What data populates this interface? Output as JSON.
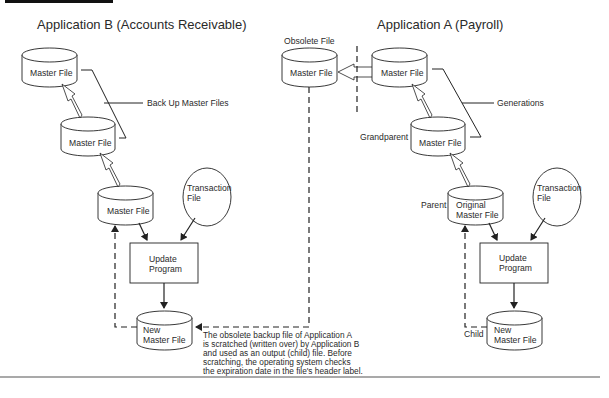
{
  "header_bar": {
    "color": "#111111"
  },
  "app_b": {
    "title": "Application B (Accounts Receivable)",
    "master_files": [
      "Master File",
      "Master File",
      "Master File"
    ],
    "bracket_label": "Back Up Master Files",
    "transaction_file": [
      "Transaction",
      "File"
    ],
    "update_program": [
      "Update",
      "Program"
    ],
    "new_master_file": [
      "New",
      "Master File"
    ]
  },
  "obsolete": {
    "label": "Obsolete File",
    "file": "Master File"
  },
  "app_a": {
    "title": "Application A (Payroll)",
    "master_file": "Master File",
    "bracket_label": "Generations",
    "grandparent_label": "Grandparent",
    "grandparent_file": "Master File",
    "parent_label": "Parent",
    "parent_file": [
      "Original",
      "Master File"
    ],
    "transaction_file": [
      "Transaction",
      "File"
    ],
    "update_program": [
      "Update",
      "Program"
    ],
    "new_master_file": [
      "New",
      "Master File"
    ],
    "child_label": "Child"
  },
  "note": [
    "The obsolete backup file of Application A",
    "is scratched (written over) by Application B",
    "and used as an output (child) file.  Before",
    "scratching, the operating system checks",
    "the expiration date in the file's header label."
  ],
  "colors": {
    "line": "#222222",
    "text": "#2a2a2a",
    "rule": "#555555"
  }
}
